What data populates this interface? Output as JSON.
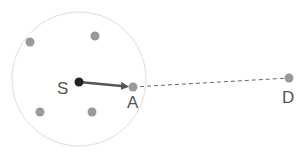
{
  "diagram": {
    "range_circle": {
      "cx": 79,
      "cy": 79,
      "r": 67,
      "stroke": "#dddddd"
    },
    "source": {
      "label": "S",
      "x": 79,
      "y": 82,
      "color": "#222222"
    },
    "next_hop": {
      "label": "A",
      "x": 133,
      "y": 87,
      "color": "#999999"
    },
    "destination": {
      "label": "D",
      "x": 289,
      "y": 78,
      "color": "#999999"
    },
    "neighbors": [
      {
        "x": 30,
        "y": 42
      },
      {
        "x": 95,
        "y": 36
      },
      {
        "x": 40,
        "y": 112
      },
      {
        "x": 92,
        "y": 112
      }
    ],
    "arrow_color": "#555555",
    "dashed_color": "#666666"
  }
}
